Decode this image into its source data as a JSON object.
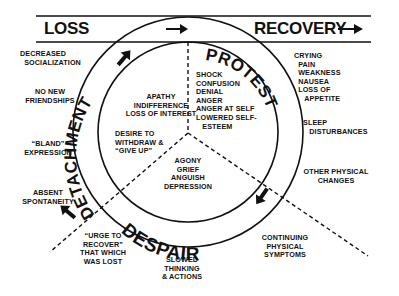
{
  "header": {
    "left_label": "LOSS",
    "right_label": "RECOVERY"
  },
  "stages": {
    "protest": "PROTEST",
    "despair": "DESPAIR",
    "detachment": "DETACHMENT"
  },
  "inner": {
    "protest_feelings": [
      "SHOCK",
      "CONFUSION",
      "DENIAL",
      "ANGER",
      "ANGER AT SELF",
      "LOWERED SELF-",
      "   ESTEEM"
    ],
    "detachment_feelings": [
      "APATHY",
      "INDIFFERENCE",
      "LOSS OF INTEREST"
    ],
    "detachment_desire": [
      "DESIRE TO",
      "WITHDRAW &",
      "“GIVE UP”"
    ],
    "despair_feelings": [
      "AGONY",
      "GRIEF",
      "ANGUISH",
      "DEPRESSION"
    ]
  },
  "outer": {
    "protest_symptoms": [
      "CRYING",
      "  PAIN",
      "  WEAKNESS",
      "  NAUSEA",
      "  LOSS OF",
      "     APPETITE"
    ],
    "sleep": [
      "SLEEP",
      "   DISTURBANCES"
    ],
    "other_physical": [
      "OTHER PHYSICAL",
      "CHANGES"
    ],
    "continuing": [
      "CONTINUING",
      "PHYSICAL",
      "SYMPTOMS"
    ],
    "slowed": [
      "SLOWED",
      "THINKING",
      "& ACTIONS"
    ],
    "urge": [
      "“URGE TO",
      "RECOVER”",
      "THAT WHICH",
      "WAS LOST"
    ],
    "decreased": [
      "DECREASED",
      "  SOCIALIZATION"
    ],
    "no_friends": [
      "NO NEW",
      "FRIENDSHIPS"
    ],
    "bland": [
      "“BLAND”",
      "EXPRESSION"
    ],
    "absent": [
      "ABSENT",
      "SPONTANEITY"
    ]
  },
  "icons": {
    "arrow": "arrow-icon"
  }
}
